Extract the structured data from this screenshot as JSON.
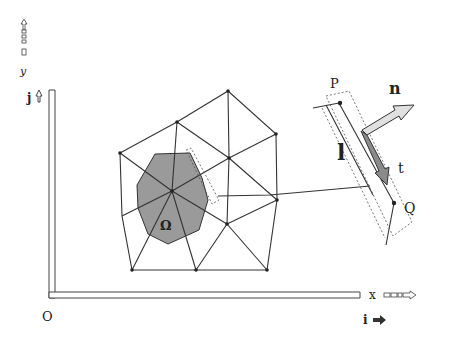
{
  "diagram": {
    "type": "finite-volume mesh with control volume and edge normal detail",
    "axes": {
      "origin_label": "O",
      "x_label": "x",
      "y_label": "y",
      "i_label": "i",
      "j_label": "j"
    },
    "mesh": {
      "region_label": "Ω",
      "region_color": "#9a9a9a",
      "nodes": [
        {
          "id": "A",
          "x": 120,
          "y": 153
        },
        {
          "id": "B",
          "x": 177,
          "y": 122
        },
        {
          "id": "C",
          "x": 228,
          "y": 91
        },
        {
          "id": "D",
          "x": 276,
          "y": 134
        },
        {
          "id": "E",
          "x": 229,
          "y": 158
        },
        {
          "id": "F",
          "x": 172,
          "y": 191
        },
        {
          "id": "G",
          "x": 122,
          "y": 216
        },
        {
          "id": "H",
          "x": 277,
          "y": 200
        },
        {
          "id": "I",
          "x": 227,
          "y": 224
        },
        {
          "id": "J",
          "x": 132,
          "y": 270
        },
        {
          "id": "K",
          "x": 196,
          "y": 270
        },
        {
          "id": "L",
          "x": 267,
          "y": 270
        }
      ]
    },
    "detail": {
      "point_p_label": "P",
      "point_q_label": "Q",
      "normal_label": "n",
      "tangent_label": "t",
      "length_label": "l"
    }
  }
}
